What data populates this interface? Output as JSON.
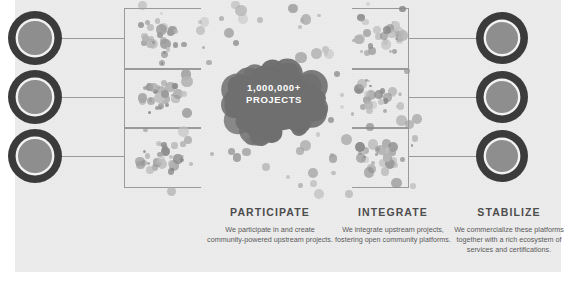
{
  "canvas": {
    "width": 575,
    "height": 291,
    "background": "#ffffff",
    "panel_color": "#ececec"
  },
  "center": {
    "line1": "1,000,000+",
    "line2": "PROJECTS",
    "text_color": "#ffffff",
    "blob_color": "#6f6f6f"
  },
  "nodes": {
    "left_count": 3,
    "right_count": 3,
    "outer_color": "#3b3b3b",
    "inner_color": "#8e8e8e",
    "ring_color": "#f2f2f2"
  },
  "connectors": {
    "line_color": "#9a9a9a",
    "left_brackets": 3,
    "right_brackets": 3
  },
  "columns": [
    {
      "heading": "PARTICIPATE",
      "body": "We participate in and create community-powered upstream projects."
    },
    {
      "heading": "INTEGRATE",
      "body": "We integrate upstream projects, fostering open community platforms."
    },
    {
      "heading": "STABILIZE",
      "body": "We commercialize these platforms together with a rich ecosystem of services and certifications."
    }
  ],
  "palette": {
    "dot_dark": "#8a8a8a",
    "dot_mid": "#a5a5a5",
    "dot_light": "#c2c2c2",
    "heading_color": "#4d4d4d",
    "body_color": "#5a5a5a"
  }
}
